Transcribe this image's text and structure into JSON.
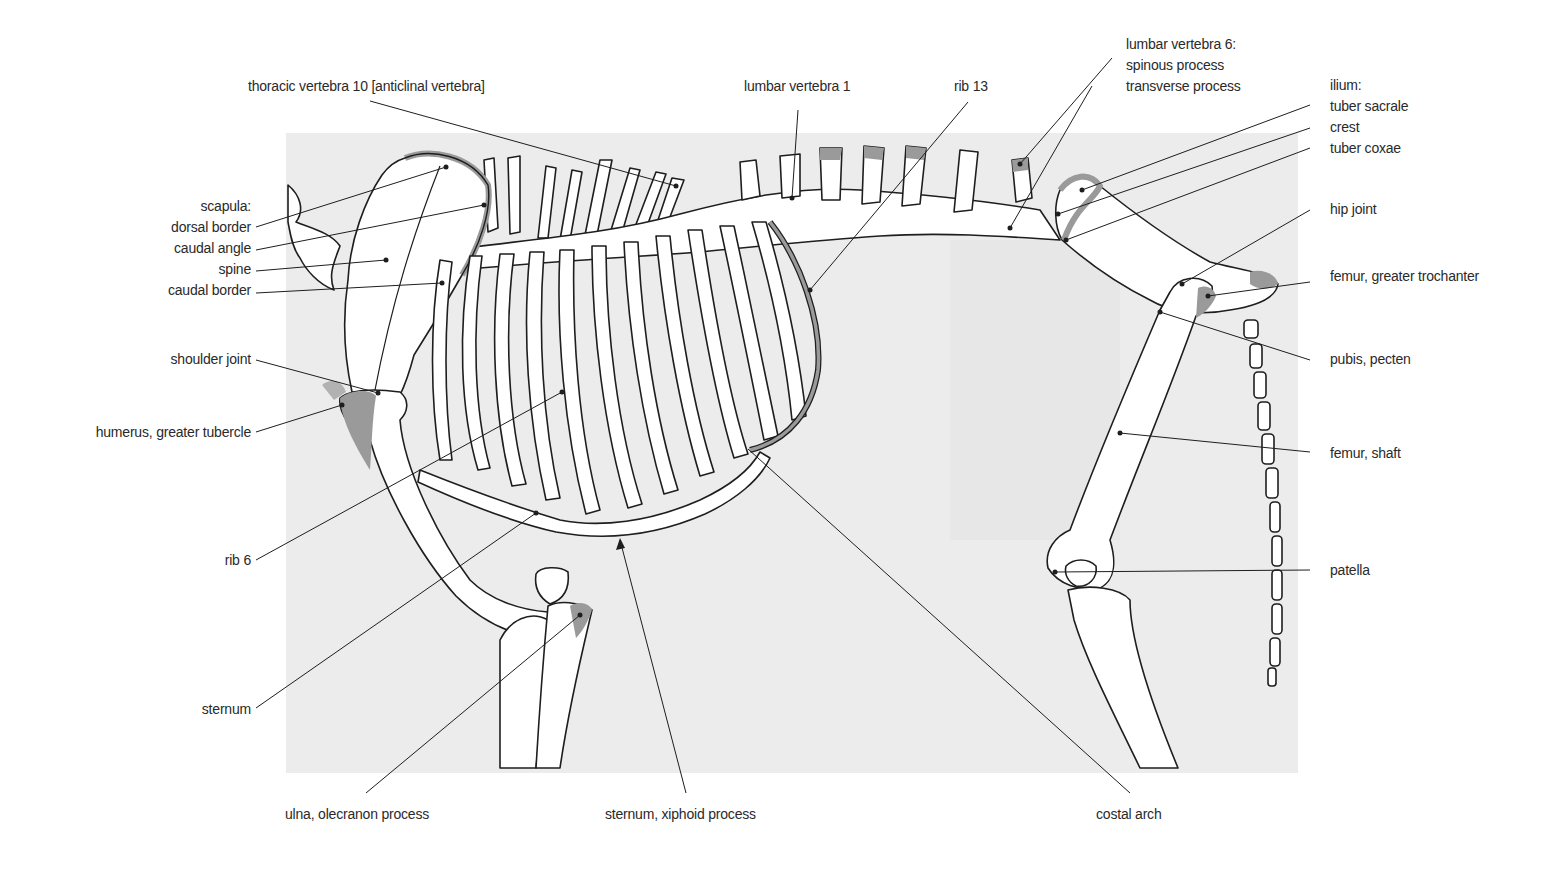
{
  "figure": {
    "background_color": "#ececec",
    "bone_fill": "#ffffff",
    "highlight_fill": "#9a9a9a",
    "line_color": "#1e1e1e"
  },
  "labels": {
    "thoracic_vertebra_10": "thoracic vertebra 10 [anticlinal vertebra]",
    "lumbar_vertebra_1": "lumbar vertebra 1",
    "rib_13": "rib 13",
    "lumbar_vertebra_6": {
      "heading": "lumbar vertebra 6:",
      "spinous_process": "spinous process",
      "transverse_process": "transverse process"
    },
    "ilium": {
      "heading": "ilium:",
      "tuber_sacrale": "tuber sacrale",
      "crest": "crest",
      "tuber_coxae": "tuber coxae"
    },
    "hip_joint": "hip joint",
    "femur_greater_trochanter": "femur, greater trochanter",
    "pubis_pecten": "pubis, pecten",
    "femur_shaft": "femur, shaft",
    "patella": "patella",
    "scapula": {
      "heading": "scapula:",
      "dorsal_border": "dorsal border",
      "caudal_angle": "caudal angle",
      "spine": "spine",
      "caudal_border": "caudal border"
    },
    "shoulder_joint": "shoulder joint",
    "humerus_greater_tubercle": "humerus, greater tubercle",
    "rib_6": "rib 6",
    "sternum": "sternum",
    "ulna_olecranon_process": "ulna, olecranon process",
    "sternum_xiphoid_process": "sternum, xiphoid process",
    "costal_arch": "costal arch"
  }
}
